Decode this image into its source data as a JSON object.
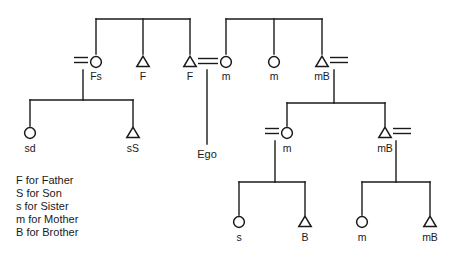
{
  "diagram": {
    "type": "kinship-chart",
    "title": "",
    "stroke_color": "#1a1a1a",
    "background_color": "#ffffff",
    "width": 458,
    "height": 261,
    "nodes": [
      {
        "id": "n-fs",
        "label": "Fs",
        "shape": "circle",
        "x": 96,
        "y": 62,
        "label_x": 96,
        "label_y": 80
      },
      {
        "id": "n-f1",
        "label": "F",
        "shape": "triangle",
        "x": 143,
        "y": 62,
        "label_x": 143,
        "label_y": 80
      },
      {
        "id": "n-f2",
        "label": "F",
        "shape": "triangle",
        "x": 190,
        "y": 62,
        "label_x": 190,
        "label_y": 80
      },
      {
        "id": "n-m1",
        "label": "m",
        "shape": "circle",
        "x": 226,
        "y": 62,
        "label_x": 226,
        "label_y": 80
      },
      {
        "id": "n-m2",
        "label": "m",
        "shape": "circle",
        "x": 274,
        "y": 62,
        "label_x": 274,
        "label_y": 80
      },
      {
        "id": "n-mb1",
        "label": "mB",
        "shape": "triangle",
        "x": 322,
        "y": 62,
        "label_x": 322,
        "label_y": 80
      },
      {
        "id": "n-sd",
        "label": "sd",
        "shape": "circle",
        "x": 30,
        "y": 133,
        "label_x": 30,
        "label_y": 152
      },
      {
        "id": "n-ss",
        "label": "sS",
        "shape": "triangle",
        "x": 133,
        "y": 133,
        "label_x": 133,
        "label_y": 152
      },
      {
        "id": "n-m3",
        "label": "m",
        "shape": "circle",
        "x": 287,
        "y": 133,
        "label_x": 287,
        "label_y": 152
      },
      {
        "id": "n-mb2",
        "label": "mB",
        "shape": "triangle",
        "x": 385,
        "y": 133,
        "label_x": 385,
        "label_y": 152
      },
      {
        "id": "n-s",
        "label": "s",
        "shape": "circle",
        "x": 239,
        "y": 222,
        "label_x": 239,
        "label_y": 241
      },
      {
        "id": "n-b",
        "label": "B",
        "shape": "triangle",
        "x": 305,
        "y": 222,
        "label_x": 305,
        "label_y": 241
      },
      {
        "id": "n-m4",
        "label": "m",
        "shape": "circle",
        "x": 362,
        "y": 222,
        "label_x": 362,
        "label_y": 241
      },
      {
        "id": "n-mb3",
        "label": "mB",
        "shape": "triangle",
        "x": 430,
        "y": 222,
        "label_x": 430,
        "label_y": 241
      }
    ],
    "ego": {
      "label": "Ego",
      "x": 207,
      "label_y": 158,
      "line_from_y": 70,
      "line_to_y": 144
    },
    "sibling_bars": [
      {
        "id": "bar-paternal",
        "y": 19,
        "x1": 96,
        "x2": 190,
        "drops": [
          96,
          143,
          190
        ],
        "drop_to": 54
      },
      {
        "id": "bar-maternal",
        "y": 19,
        "x1": 226,
        "x2": 322,
        "drops": [
          226,
          274,
          322
        ],
        "drop_to": 54
      },
      {
        "id": "bar-fs-children",
        "y": 100,
        "x1": 30,
        "x2": 133,
        "drops": [
          30,
          133
        ],
        "drop_to": 126,
        "stem_x": 83,
        "stem_from": 70,
        "stem_to": 100
      },
      {
        "id": "bar-mb1-children",
        "y": 103,
        "x1": 287,
        "x2": 385,
        "drops": [
          287,
          385
        ],
        "drop_to": 126,
        "stem_x": 334,
        "stem_from": 70,
        "stem_to": 103
      },
      {
        "id": "bar-m3-children",
        "y": 182,
        "x1": 239,
        "x2": 305,
        "drops": [
          239,
          305
        ],
        "drop_to": 215,
        "stem_x": 275,
        "stem_from": 141,
        "stem_to": 182
      },
      {
        "id": "bar-mb2-children",
        "y": 182,
        "x1": 362,
        "x2": 430,
        "drops": [
          362,
          430
        ],
        "drop_to": 215,
        "stem_x": 396,
        "stem_from": 141,
        "stem_to": 182
      }
    ],
    "marriages": [
      {
        "id": "marriage-fs",
        "x1": 74,
        "x2": 88,
        "y": 60
      },
      {
        "id": "marriage-f2m",
        "x1": 198,
        "x2": 218,
        "y": 61
      },
      {
        "id": "marriage-mb1",
        "x1": 330,
        "x2": 348,
        "y": 60
      },
      {
        "id": "marriage-m3",
        "x1": 265,
        "x2": 279,
        "y": 131
      },
      {
        "id": "marriage-mb2",
        "x1": 393,
        "x2": 411,
        "y": 131
      }
    ],
    "legend": [
      "F for Father",
      "S for Son",
      "s for Sister",
      "m for Mother",
      "B for Brother"
    ],
    "legend_origin": {
      "x": 16,
      "y": 184,
      "line_height": 13
    }
  }
}
